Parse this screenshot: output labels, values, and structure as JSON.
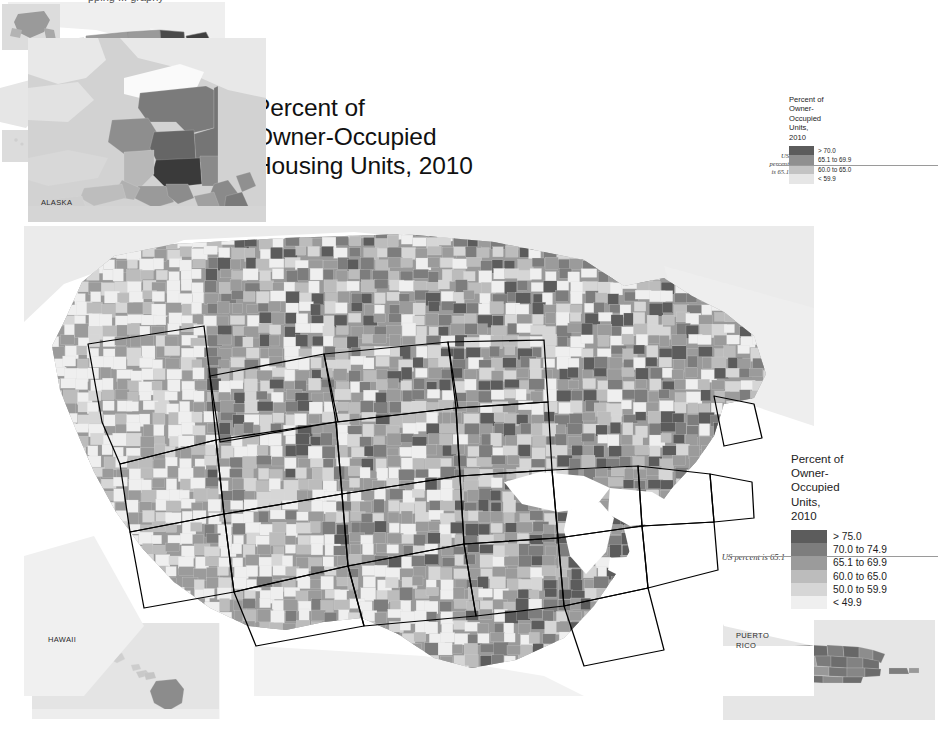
{
  "title": {
    "text": "Percent of\nOwner-Occupied\nHousing Units, 2010"
  },
  "top_cropped_text": "pping        ...        graphy",
  "insets": {
    "alaska": {
      "label": "ALASKA"
    },
    "hawaii": {
      "label": "HAWAII"
    },
    "puerto_rico": {
      "label": "PUERTO\nRICO"
    }
  },
  "main_legend": {
    "title": "Percent of\nOwner-\nOccupied\nUnits,\n2010",
    "us_note": "US percent is 65.1",
    "classes": [
      {
        "label": "> 75.0",
        "color": "#5c5c5c"
      },
      {
        "label": "70.0 to 74.9",
        "color": "#7d7d7d"
      },
      {
        "label": "65.1 to 69.9",
        "color": "#9b9b9b"
      },
      {
        "label": "60.0 to 65.0",
        "color": "#bcbcbc"
      },
      {
        "label": "50.0 to 59.9",
        "color": "#d6d6d6"
      },
      {
        "label": "< 49.9",
        "color": "#efefef"
      }
    ]
  },
  "inset_legend": {
    "title": "Percent of\nOwner-\nOccupied\nUnits,\n2010",
    "us_note": "US\npercent\nis 65.1",
    "classes": [
      {
        "label": "> 70.0",
        "color": "#5c5c5c"
      },
      {
        "label": "65.1 to 69.9",
        "color": "#8f8f8f"
      },
      {
        "label": "60.0 to 65.0",
        "color": "#c3c3c3"
      },
      {
        "label": "< 59.9",
        "color": "#e6e6e6"
      }
    ]
  },
  "chart_data": {
    "type": "heatmap",
    "title": "Percent of Owner-Occupied Housing Units, 2010",
    "subtitle": "US county-level choropleth map, grayscale classed",
    "unit": "percent",
    "national_value": 65.1,
    "county_legend_breaks": [
      49.9,
      59.9,
      65.0,
      69.9,
      74.9,
      75.0
    ],
    "state_legend_breaks": [
      59.9,
      65.0,
      69.9,
      70.0
    ],
    "legend_position": "right",
    "colors": {
      "background": "#ffffff",
      "water": "#ffffff",
      "foreign_land": "#ebebeb",
      "state_boundary": "#000000",
      "county_boundary": "#d9d9d9"
    },
    "state_values": [
      {
        "state": "Maine",
        "class": "> 70.0"
      },
      {
        "state": "Vermont",
        "class": "> 70.0"
      },
      {
        "state": "New Hampshire",
        "class": "65.1 to 69.9"
      },
      {
        "state": "Minnesota",
        "class": "> 70.0"
      },
      {
        "state": "Michigan",
        "class": "> 70.0"
      },
      {
        "state": "Iowa",
        "class": "> 70.0"
      },
      {
        "state": "Idaho",
        "class": "> 70.0"
      },
      {
        "state": "West Virginia",
        "class": "> 70.0"
      },
      {
        "state": "Delaware",
        "class": "> 70.0"
      },
      {
        "state": "Washington",
        "class": "60.0 to 65.0"
      },
      {
        "state": "Oregon",
        "class": "60.0 to 65.0"
      },
      {
        "state": "Texas",
        "class": "60.0 to 65.0"
      },
      {
        "state": "California",
        "class": "< 59.9"
      },
      {
        "state": "Nevada",
        "class": "< 59.9"
      },
      {
        "state": "New York",
        "class": "< 59.9"
      },
      {
        "state": "Alaska",
        "class": "65.1 to 69.9"
      },
      {
        "state": "Hawaii",
        "class": "< 59.9"
      }
    ]
  }
}
